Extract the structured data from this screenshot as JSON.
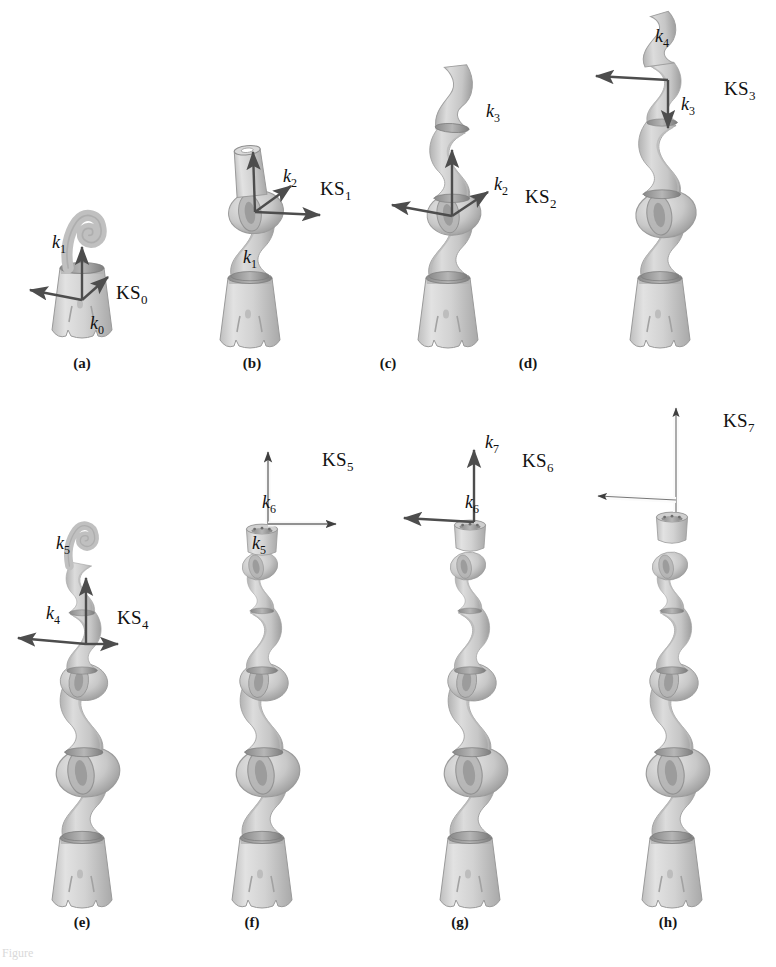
{
  "figure": {
    "background": "#ffffff",
    "model_color": "#d6d6d6",
    "model_shade": "#a9a9a9",
    "joint_band_color": "#8f8f8f",
    "arrow_color": "#4d4d4d",
    "arrow_light_color": "#f2f2f2",
    "caption_fragment": "Figure"
  },
  "panels": [
    {
      "id": "a",
      "label": "(a)",
      "frame": "KS0",
      "frame_label": "KS",
      "frame_sub": "0",
      "axes": [
        {
          "name": "k1",
          "base": "k",
          "sub": "1"
        },
        {
          "name": "k0",
          "base": "k",
          "sub": "0"
        }
      ],
      "joints_shown": 1
    },
    {
      "id": "b",
      "label": "(b)",
      "frame": "KS1",
      "frame_label": "KS",
      "frame_sub": "1",
      "axes": [
        {
          "name": "k2",
          "base": "k",
          "sub": "2"
        },
        {
          "name": "k1",
          "base": "k",
          "sub": "1"
        }
      ],
      "joints_shown": 2
    },
    {
      "id": "c",
      "label": "(c)",
      "frame": "KS2",
      "frame_label": "KS",
      "frame_sub": "2",
      "axes": [
        {
          "name": "k3",
          "base": "k",
          "sub": "3"
        },
        {
          "name": "k2",
          "base": "k",
          "sub": "2"
        }
      ],
      "joints_shown": 3
    },
    {
      "id": "d",
      "label": "(d)",
      "frame": "KS3",
      "frame_label": "KS",
      "frame_sub": "3",
      "axes": [
        {
          "name": "k4",
          "base": "k",
          "sub": "4"
        },
        {
          "name": "k3",
          "base": "k",
          "sub": "3"
        }
      ],
      "joints_shown": 4
    },
    {
      "id": "e",
      "label": "(e)",
      "frame": "KS4",
      "frame_label": "KS",
      "frame_sub": "4",
      "axes": [
        {
          "name": "k5",
          "base": "k",
          "sub": "5"
        },
        {
          "name": "k4",
          "base": "k",
          "sub": "4"
        }
      ],
      "joints_shown": 5
    },
    {
      "id": "f",
      "label": "(f)",
      "frame": "KS5",
      "frame_label": "KS",
      "frame_sub": "5",
      "axes": [
        {
          "name": "k6",
          "base": "k",
          "sub": "6"
        },
        {
          "name": "k5",
          "base": "k",
          "sub": "5"
        }
      ],
      "joints_shown": 6
    },
    {
      "id": "g",
      "label": "(g)",
      "frame": "KS6",
      "frame_label": "KS",
      "frame_sub": "6",
      "axes": [
        {
          "name": "k7",
          "base": "k",
          "sub": "7"
        },
        {
          "name": "k6",
          "base": "k",
          "sub": "6"
        }
      ],
      "joints_shown": 7
    },
    {
      "id": "h",
      "label": "(h)",
      "frame": "KS7",
      "frame_label": "KS",
      "frame_sub": "7",
      "axes": [],
      "joints_shown": 7
    }
  ]
}
